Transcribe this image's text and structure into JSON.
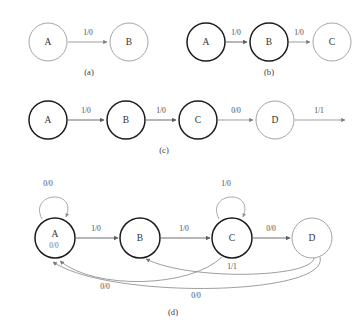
{
  "figure": {
    "panels": [
      {
        "id": "a",
        "caption": "(a)",
        "nodes": [
          {
            "label": "A",
            "style": "gray",
            "cx": 48,
            "cy": 42,
            "r": 19
          },
          {
            "label": "B",
            "style": "gray",
            "cx": 129,
            "cy": 42,
            "r": 19
          }
        ],
        "edges": [
          {
            "from": "A",
            "to": "B",
            "label": "1/0",
            "kind": "forward"
          }
        ]
      },
      {
        "id": "b",
        "caption": "(b)",
        "nodes": [
          {
            "label": "A",
            "style": "bold",
            "cx": 206,
            "cy": 42,
            "r": 19
          },
          {
            "label": "B",
            "style": "bold",
            "cx": 269,
            "cy": 42,
            "r": 19
          },
          {
            "label": "C",
            "style": "gray",
            "cx": 332,
            "cy": 42,
            "r": 19
          }
        ],
        "edges": [
          {
            "from": "A",
            "to": "B",
            "label": "1/0",
            "kind": "forward"
          },
          {
            "from": "B",
            "to": "C",
            "label": "1/0",
            "kind": "forward"
          }
        ]
      },
      {
        "id": "c",
        "caption": "(c)",
        "nodes": [
          {
            "label": "A",
            "style": "bold",
            "cx": 48,
            "cy": 120,
            "r": 19
          },
          {
            "label": "B",
            "style": "bold",
            "cx": 126,
            "cy": 120,
            "r": 19
          },
          {
            "label": "C",
            "style": "bold",
            "cx": 198,
            "cy": 120,
            "r": 19
          },
          {
            "label": "D",
            "style": "gray",
            "cx": 275,
            "cy": 120,
            "r": 19
          }
        ],
        "edges": [
          {
            "from": "A",
            "to": "B",
            "label": "1/0",
            "kind": "forward"
          },
          {
            "from": "B",
            "to": "C",
            "label": "1/0",
            "kind": "forward"
          },
          {
            "from": "C",
            "to": "D",
            "label": "0/0",
            "kind": "forward"
          },
          {
            "from": "D",
            "to": "",
            "label": "1/1",
            "kind": "dangling"
          }
        ]
      },
      {
        "id": "d",
        "caption": "(d)",
        "nodes": [
          {
            "label": "A",
            "style": "bold",
            "cx": 55,
            "cy": 238,
            "r": 20
          },
          {
            "label": "B",
            "style": "bold",
            "cx": 140,
            "cy": 238,
            "r": 20
          },
          {
            "label": "C",
            "style": "bold",
            "cx": 232,
            "cy": 238,
            "r": 20
          },
          {
            "label": "D",
            "style": "gray",
            "cx": 312,
            "cy": 238,
            "r": 20
          }
        ],
        "edges": [
          {
            "from": "A",
            "to": "A",
            "label": "0/0",
            "kind": "self-loop"
          },
          {
            "from": "A",
            "to": "B",
            "label": "1/0",
            "kind": "forward"
          },
          {
            "from": "B",
            "to": "C",
            "label": "1/0",
            "kind": "forward"
          },
          {
            "from": "C",
            "to": "C",
            "label": "1/0",
            "kind": "self-loop"
          },
          {
            "from": "C",
            "to": "D",
            "label": "0/0",
            "kind": "forward"
          },
          {
            "from": "C",
            "to": "A",
            "label": "0/0",
            "kind": "back"
          },
          {
            "from": "D",
            "to": "B",
            "label": "1/1",
            "kind": "back"
          },
          {
            "from": "D",
            "to": "A",
            "label": "0/0",
            "kind": "back"
          }
        ],
        "overlap_artifact": "0/0"
      }
    ]
  },
  "colors": {
    "node_gray_stroke": "#9a9a9a",
    "node_bold_stroke": "#1d1d1d",
    "edge_stroke": "#8c8c8c",
    "label_text": "#4a4a4a",
    "background": "#ffffff"
  }
}
